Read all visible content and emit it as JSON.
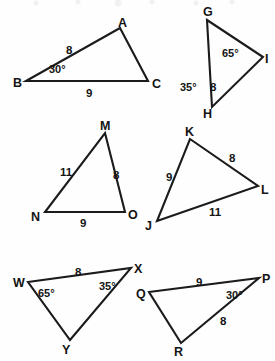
{
  "figure": {
    "background_color": "#fefefe",
    "line_color": "#1b1b1b",
    "text_color": "#141414",
    "triangles": [
      {
        "name": "triangle-abc",
        "vertices": [
          {
            "label": "A",
            "x": 120,
            "y": 28,
            "lx": 118,
            "ly": 17
          },
          {
            "label": "B",
            "x": 26,
            "y": 81,
            "lx": 13,
            "ly": 77
          },
          {
            "label": "C",
            "x": 148,
            "y": 81,
            "lx": 152,
            "ly": 78
          }
        ],
        "path": "M 26 81 L 120 28 L 148 81 Z",
        "sides": [
          {
            "label": "8",
            "x": 66,
            "y": 45
          },
          {
            "label": "9",
            "x": 86,
            "y": 88
          }
        ],
        "angles": [
          {
            "label": "30°",
            "x": 49,
            "y": 64
          }
        ]
      },
      {
        "name": "triangle-ghi",
        "vertices": [
          {
            "label": "G",
            "x": 207,
            "y": 20,
            "lx": 203,
            "ly": 6
          },
          {
            "label": "H",
            "x": 212,
            "y": 107,
            "lx": 203,
            "ly": 108
          },
          {
            "label": "I",
            "x": 263,
            "y": 57,
            "lx": 265,
            "ly": 53
          }
        ],
        "path": "M 207 20 L 263 57 L 212 107 Z",
        "sides": [
          {
            "label": "8",
            "x": 210,
            "y": 82
          }
        ],
        "angles": [
          {
            "label": "65°",
            "x": 222,
            "y": 48
          },
          {
            "label": "35°",
            "x": 180,
            "y": 82
          }
        ]
      },
      {
        "name": "triangle-mno",
        "vertices": [
          {
            "label": "M",
            "x": 105,
            "y": 133,
            "lx": 100,
            "ly": 120
          },
          {
            "label": "N",
            "x": 45,
            "y": 212,
            "lx": 31,
            "ly": 211
          },
          {
            "label": "O",
            "x": 125,
            "y": 212,
            "lx": 128,
            "ly": 209
          }
        ],
        "path": "M 105 133 L 125 212 L 45 212 Z",
        "sides": [
          {
            "label": "11",
            "x": 60,
            "y": 167
          },
          {
            "label": "8",
            "x": 113,
            "y": 170
          },
          {
            "label": "9",
            "x": 80,
            "y": 218
          }
        ],
        "angles": []
      },
      {
        "name": "triangle-jkl",
        "vertices": [
          {
            "label": "K",
            "x": 190,
            "y": 139,
            "lx": 185,
            "ly": 126
          },
          {
            "label": "L",
            "x": 258,
            "y": 186,
            "lx": 261,
            "ly": 184
          },
          {
            "label": "J",
            "x": 157,
            "y": 221,
            "lx": 145,
            "ly": 220
          }
        ],
        "path": "M 190 139 L 258 186 L 157 221 Z",
        "sides": [
          {
            "label": "8",
            "x": 229,
            "y": 153
          },
          {
            "label": "9",
            "x": 166,
            "y": 172
          },
          {
            "label": "11",
            "x": 209,
            "y": 207
          }
        ],
        "angles": []
      },
      {
        "name": "triangle-wxy",
        "vertices": [
          {
            "label": "W",
            "x": 28,
            "y": 282,
            "lx": 13,
            "ly": 277
          },
          {
            "label": "X",
            "x": 131,
            "y": 268,
            "lx": 134,
            "ly": 263
          },
          {
            "label": "Y",
            "x": 70,
            "y": 340,
            "lx": 62,
            "ly": 344
          }
        ],
        "path": "M 28 282 L 131 268 L 70 340 Z",
        "sides": [
          {
            "label": "8",
            "x": 75,
            "y": 267
          }
        ],
        "angles": [
          {
            "label": "65°",
            "x": 38,
            "y": 288
          },
          {
            "label": "35°",
            "x": 99,
            "y": 281
          }
        ]
      },
      {
        "name": "triangle-pqr",
        "vertices": [
          {
            "label": "Q",
            "x": 149,
            "y": 292,
            "lx": 136,
            "ly": 288
          },
          {
            "label": "P",
            "x": 259,
            "y": 278,
            "lx": 262,
            "ly": 273
          },
          {
            "label": "R",
            "x": 181,
            "y": 343,
            "lx": 174,
            "ly": 346
          }
        ],
        "path": "M 149 292 L 259 278 L 181 343 Z",
        "sides": [
          {
            "label": "9",
            "x": 196,
            "y": 277
          },
          {
            "label": "8",
            "x": 220,
            "y": 316
          }
        ],
        "angles": [
          {
            "label": "30°",
            "x": 226,
            "y": 290
          }
        ]
      }
    ]
  }
}
